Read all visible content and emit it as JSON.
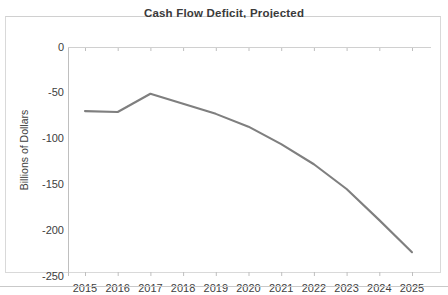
{
  "chart_data": {
    "type": "line",
    "title": "Cash Flow Deficit, Projected",
    "xlabel": "",
    "ylabel": "Billions of Dollars",
    "categories": [
      "2015",
      "2016",
      "2017",
      "2018",
      "2019",
      "2020",
      "2021",
      "2022",
      "2023",
      "2024",
      "2025"
    ],
    "series": [
      {
        "name": "Cash Flow Deficit",
        "color": "#7f7f7f",
        "values": [
          -70,
          -71,
          -51,
          -62,
          -73,
          -87,
          -106,
          -128,
          -155,
          -189,
          -224
        ]
      }
    ],
    "ylim": [
      -250,
      0
    ],
    "yticks": [
      0,
      -50,
      -100,
      -150,
      -200,
      -250
    ],
    "ytick_labels": [
      "0",
      "-50",
      "-100",
      "-150",
      "-200",
      "-250"
    ],
    "grid": false,
    "legend": "none",
    "axis_line_color": "#bfbfbf",
    "tick_color": "#bfbfbf",
    "text_color": "#404040",
    "plot_background": "#ffffff",
    "frame_border_color": "#d9d9d9"
  }
}
